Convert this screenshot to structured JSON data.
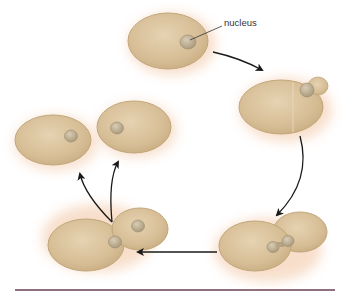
{
  "diagram": {
    "type": "yeast budding cell cycle",
    "labels": {
      "nucleus": "nucleus"
    },
    "stages": [
      {
        "id": "mother-cell",
        "description": "single cell with nucleus"
      },
      {
        "id": "early-bud",
        "description": "cell with small bud emerging, nucleus at bud neck"
      },
      {
        "id": "nuclear-division",
        "description": "large bud, nucleus dividing across neck"
      },
      {
        "id": "cell-separation",
        "description": "mother and daughter cells each with nucleus, separating"
      },
      {
        "id": "two-cells",
        "description": "two separate daughter cells"
      }
    ],
    "colors": {
      "cell_fill": "#d9c29c",
      "cell_edge": "#c2a67a",
      "glow": "#f3c9a8",
      "nucleus": "#b8a98c",
      "arrow": "#1a1a1a",
      "rule": "#6b3f55"
    }
  }
}
